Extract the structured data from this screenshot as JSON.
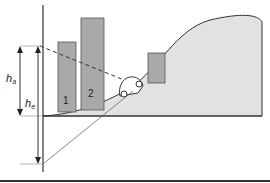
{
  "diagram": {
    "type": "terrain-shadowing",
    "buildings": [
      {
        "label": "1"
      },
      {
        "label": "2"
      },
      {
        "label": ""
      }
    ],
    "labels": {
      "h_a_main": "h",
      "h_a_sub": "a",
      "h_e_main": "h",
      "h_e_sub": "e"
    },
    "colors": {
      "terrain_fill": "#e2e2e2",
      "building_fill": "#a9a9a9",
      "line": "#333333"
    }
  }
}
